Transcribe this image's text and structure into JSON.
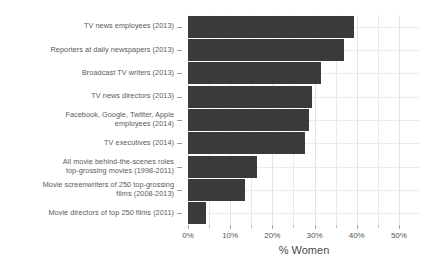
{
  "chart_data": {
    "type": "bar",
    "orientation": "horizontal",
    "title": "",
    "xlabel": "% Women",
    "ylabel": "",
    "xlim": [
      0,
      55
    ],
    "grid": true,
    "legend": "none",
    "bar_color": "#3a3a3a",
    "grid_color": "#e9e9e9",
    "categories": [
      "TV news employees (2013)",
      "Reporters at daily newspapers (2013)",
      "Broadcast TV writers (2013)",
      "TV news directors (2013)",
      "Facebook, Google, Twitter, Apple employees (2014)",
      "TV executives (2014)",
      "All movie behind-the-scenes roles top-grossing movies (1998-2011)",
      "Movie screenwriters of 250 top-grossing films (2008-2013)",
      "Movie directors of top 250 films (2011)"
    ],
    "category_lines": [
      [
        "TV news employees (2013)"
      ],
      [
        "Reporters at daily newspapers (2013)"
      ],
      [
        "Broadcast TV writers (2013)"
      ],
      [
        "TV news directors (2013)"
      ],
      [
        "Facebook, Google, Twitter, Apple",
        "employees (2014)"
      ],
      [
        "TV executives (2014)"
      ],
      [
        "All movie behind-the-scenes roles",
        "top-grossing movies (1998-2011)"
      ],
      [
        "Movie screenwriters of 250 top-grossing",
        "films (2008-2013)"
      ],
      [
        "Movie directors of top 250 films (2011)"
      ]
    ],
    "values": [
      39.3,
      36.9,
      31.6,
      29.5,
      28.6,
      27.7,
      16.4,
      13.4,
      4.3
    ],
    "xticks": [
      0,
      10,
      20,
      30,
      40,
      50
    ],
    "xtick_labels": [
      "0%",
      "10%",
      "20%",
      "30%",
      "40%",
      "50%"
    ],
    "xticks_minor": [
      5,
      15,
      25,
      35,
      45
    ]
  }
}
